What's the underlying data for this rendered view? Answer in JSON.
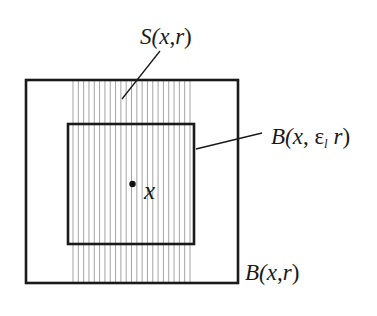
{
  "diagram": {
    "type": "nested-squares-with-hatched-strip",
    "colors": {
      "background": "#ffffff",
      "outline": "#1a1a1a",
      "hatch": "#9a9a9a"
    },
    "outer_square": {
      "label": "B(x,r)",
      "x1": 26,
      "y1": 80,
      "x2": 238,
      "y2": 283
    },
    "inner_square": {
      "label": "B(x, ε_l r)",
      "x1": 68,
      "y1": 124,
      "x2": 194,
      "y2": 244
    },
    "strip": {
      "label": "S(x,r)",
      "x_start": 73,
      "x_end": 190,
      "line_count": 23
    },
    "center_point": {
      "label": "x",
      "cx": 132,
      "cy": 184
    }
  },
  "labels": {
    "strip": {
      "prefix": "S(",
      "x": "x",
      "sep": ",",
      "r": "r",
      "suffix": ")"
    },
    "inner": {
      "prefix": "B(",
      "x": "x",
      "sep": ", ",
      "eps": "ε",
      "sub": "l",
      "r": " r",
      "suffix": ")"
    },
    "outer": {
      "prefix": "B(",
      "x": "x",
      "sep": ",",
      "r": "r",
      "suffix": ")"
    },
    "point": "x"
  }
}
